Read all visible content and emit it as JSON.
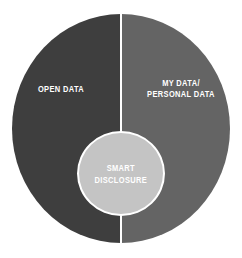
{
  "diagram": {
    "type": "venn-split-circle",
    "title": "",
    "background_color": "#ffffff",
    "divider_color": "#ffffff",
    "segments": [
      {
        "id": "open-data",
        "label": "OPEN DATA",
        "color": "#3e3e3e",
        "position": "left-half"
      },
      {
        "id": "my-data-personal-data",
        "label": "MY DATA/\nPERSONAL DATA",
        "color": "#646464",
        "position": "right-half"
      }
    ],
    "center": {
      "id": "smart-disclosure",
      "label": "SMART\nDISCLOSURE",
      "color": "#c4c4c4",
      "ring_color": "#ffffff",
      "text_color": "#ffffff"
    }
  }
}
